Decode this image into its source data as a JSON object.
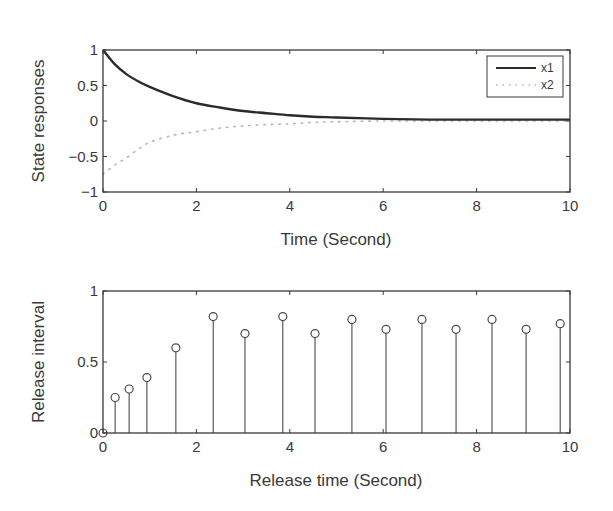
{
  "chart_data": [
    {
      "type": "line",
      "id": "state-responses",
      "title": "",
      "xlabel": "Time (Second)",
      "ylabel": "State responses",
      "xlim": [
        0,
        10
      ],
      "ylim": [
        -1,
        1
      ],
      "xticks": [
        0,
        2,
        4,
        6,
        8,
        10
      ],
      "xtick_labels": [
        "0",
        "2",
        "4",
        "6",
        "8",
        "10"
      ],
      "yticks": [
        -1,
        -0.5,
        0,
        0.5,
        1
      ],
      "ytick_labels": [
        "−1",
        "−0.5",
        "0",
        "0.5",
        "1"
      ],
      "grid": false,
      "legend_position": "upper right",
      "series": [
        {
          "name": "x1",
          "style": "solid",
          "color": "#2b2b2b",
          "x": [
            0,
            0.25,
            0.5,
            0.75,
            1,
            1.5,
            2,
            2.5,
            3,
            3.5,
            4,
            4.5,
            5,
            6,
            7,
            8,
            9,
            10
          ],
          "y": [
            1,
            0.8,
            0.66,
            0.56,
            0.48,
            0.35,
            0.25,
            0.19,
            0.14,
            0.11,
            0.08,
            0.06,
            0.05,
            0.03,
            0.02,
            0.02,
            0.02,
            0.02
          ]
        },
        {
          "name": "x2",
          "style": "dotted",
          "color": "#b5b5b5",
          "x": [
            0,
            0.25,
            0.5,
            0.75,
            1,
            1.5,
            2,
            2.5,
            3,
            3.5,
            4,
            4.5,
            5,
            6,
            7,
            8,
            9,
            10
          ],
          "y": [
            -0.75,
            -0.62,
            -0.52,
            -0.4,
            -0.3,
            -0.2,
            -0.15,
            -0.1,
            -0.07,
            -0.05,
            -0.04,
            -0.02,
            -0.01,
            0,
            0,
            0,
            0,
            0
          ]
        }
      ]
    },
    {
      "type": "stem",
      "id": "release-interval",
      "title": "",
      "xlabel": "Release time (Second)",
      "ylabel": "Release interval",
      "xlim": [
        0,
        10
      ],
      "ylim": [
        0,
        1
      ],
      "xticks": [
        0,
        2,
        4,
        6,
        8,
        10
      ],
      "xtick_labels": [
        "0",
        "2",
        "4",
        "6",
        "8",
        "10"
      ],
      "yticks": [
        0,
        0.5,
        1
      ],
      "ytick_labels": [
        "0",
        "0.5",
        "1"
      ],
      "grid": false,
      "series": [
        {
          "name": "release interval",
          "marker": "circle",
          "color": "#4a4a4a",
          "x": [
            0,
            0.26,
            0.56,
            0.94,
            1.56,
            2.36,
            3.04,
            3.85,
            4.54,
            5.33,
            6.06,
            6.83,
            7.56,
            8.33,
            9.06,
            9.79
          ],
          "y": [
            0,
            0.25,
            0.31,
            0.39,
            0.6,
            0.82,
            0.7,
            0.82,
            0.7,
            0.8,
            0.73,
            0.8,
            0.73,
            0.8,
            0.73,
            0.77
          ]
        }
      ]
    }
  ]
}
